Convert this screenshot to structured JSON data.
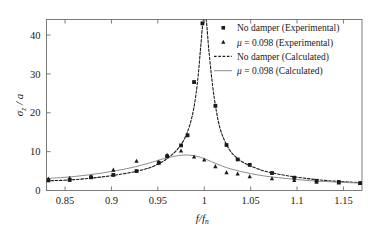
{
  "chart_data": {
    "type": "line",
    "title": "",
    "xlabel": "f/f_n",
    "ylabel": "σ_z / a",
    "xlabel_main": "f/f",
    "xlabel_subscript": "n",
    "ylabel_main": "σ",
    "ylabel_subscript": "z",
    "ylabel_tail": " / a",
    "xlim": [
      0.83,
      1.17
    ],
    "ylim": [
      0,
      44
    ],
    "xticks": [
      0.85,
      0.9,
      0.95,
      1,
      1.05,
      1.1,
      1.15
    ],
    "xtick_labels": [
      "0.85",
      "0.9",
      "0.95",
      "1",
      "1.05",
      "1.1",
      "1.15"
    ],
    "yticks": [
      0,
      10,
      20,
      30,
      40
    ],
    "ytick_labels": [
      "0",
      "10",
      "20",
      "30",
      "40"
    ],
    "grid": false,
    "legend_position": "top-right",
    "colors": {
      "no_damper": "#1a1a1a",
      "damper": "#8c8c8c",
      "axis": "#6e6e6e",
      "text": "#1a1a1a"
    },
    "series": [
      {
        "name": "No damper (Experimental)",
        "kind": "scatter",
        "marker": "square",
        "color": "#1a1a1a",
        "points": [
          [
            0.832,
            2.6
          ],
          [
            0.855,
            2.7
          ],
          [
            0.878,
            3.4
          ],
          [
            0.902,
            4.0
          ],
          [
            0.927,
            5.0
          ],
          [
            0.951,
            7.1
          ],
          [
            0.96,
            8.8
          ],
          [
            0.975,
            11.6
          ],
          [
            0.982,
            14.2
          ],
          [
            0.989,
            27.9
          ],
          [
            0.998,
            43.0
          ],
          [
            1.012,
            21.8
          ],
          [
            1.024,
            11.7
          ],
          [
            1.036,
            8.0
          ],
          [
            1.049,
            6.6
          ],
          [
            1.073,
            4.5
          ],
          [
            1.097,
            3.3
          ],
          [
            1.121,
            2.5
          ],
          [
            1.145,
            2.2
          ],
          [
            1.168,
            1.9
          ]
        ]
      },
      {
        "name": "μ = 0.098 (Experimental)",
        "kind": "scatter",
        "marker": "triangle",
        "color": "#1a1a1a",
        "points": [
          [
            0.832,
            3.0
          ],
          [
            0.855,
            3.2
          ],
          [
            0.878,
            3.6
          ],
          [
            0.902,
            5.3
          ],
          [
            0.927,
            7.6
          ],
          [
            0.951,
            7.4
          ],
          [
            0.96,
            9.1
          ],
          [
            0.975,
            10.2
          ],
          [
            0.989,
            8.7
          ],
          [
            1.0,
            7.9
          ],
          [
            1.012,
            6.2
          ],
          [
            1.024,
            4.6
          ],
          [
            1.036,
            4.3
          ],
          [
            1.049,
            3.6
          ],
          [
            1.073,
            3.1
          ],
          [
            1.097,
            2.6
          ],
          [
            1.121,
            2.2
          ],
          [
            1.145,
            2.0
          ],
          [
            1.168,
            1.9
          ]
        ]
      },
      {
        "name": "No damper (Calculated)",
        "kind": "line",
        "style": "dashed",
        "color": "#1a1a1a",
        "points": [
          [
            0.83,
            2.5
          ],
          [
            0.845,
            2.6
          ],
          [
            0.86,
            2.8
          ],
          [
            0.875,
            3.1
          ],
          [
            0.89,
            3.5
          ],
          [
            0.905,
            4.0
          ],
          [
            0.92,
            4.6
          ],
          [
            0.935,
            5.4
          ],
          [
            0.945,
            6.2
          ],
          [
            0.955,
            7.4
          ],
          [
            0.962,
            8.6
          ],
          [
            0.97,
            10.3
          ],
          [
            0.978,
            13.0
          ],
          [
            0.984,
            16.5
          ],
          [
            0.989,
            21.5
          ],
          [
            0.993,
            28.5
          ],
          [
            0.996,
            36.5
          ],
          [
            0.999,
            44.0
          ],
          [
            1.002,
            44.0
          ],
          [
            1.005,
            36.0
          ],
          [
            1.009,
            27.0
          ],
          [
            1.013,
            20.5
          ],
          [
            1.017,
            16.0
          ],
          [
            1.022,
            12.8
          ],
          [
            1.028,
            10.2
          ],
          [
            1.035,
            8.4
          ],
          [
            1.043,
            7.1
          ],
          [
            1.052,
            6.1
          ],
          [
            1.065,
            5.0
          ],
          [
            1.08,
            4.2
          ],
          [
            1.095,
            3.6
          ],
          [
            1.11,
            3.1
          ],
          [
            1.125,
            2.7
          ],
          [
            1.14,
            2.4
          ],
          [
            1.155,
            2.2
          ],
          [
            1.17,
            2.0
          ]
        ]
      },
      {
        "name": "μ = 0.098 (Calculated)",
        "kind": "line",
        "style": "solid",
        "color": "#8c8c8c",
        "points": [
          [
            0.83,
            3.1
          ],
          [
            0.845,
            3.3
          ],
          [
            0.86,
            3.6
          ],
          [
            0.875,
            4.0
          ],
          [
            0.89,
            4.5
          ],
          [
            0.905,
            5.1
          ],
          [
            0.92,
            5.8
          ],
          [
            0.932,
            6.5
          ],
          [
            0.944,
            7.3
          ],
          [
            0.952,
            7.9
          ],
          [
            0.96,
            8.4
          ],
          [
            0.968,
            8.8
          ],
          [
            0.976,
            9.1
          ],
          [
            0.984,
            9.1
          ],
          [
            0.992,
            8.8
          ],
          [
            1.0,
            8.2
          ],
          [
            1.008,
            7.4
          ],
          [
            1.016,
            6.6
          ],
          [
            1.024,
            5.9
          ],
          [
            1.034,
            5.2
          ],
          [
            1.045,
            4.6
          ],
          [
            1.058,
            4.0
          ],
          [
            1.072,
            3.5
          ],
          [
            1.088,
            3.1
          ],
          [
            1.105,
            2.7
          ],
          [
            1.122,
            2.4
          ],
          [
            1.14,
            2.2
          ],
          [
            1.158,
            2.0
          ],
          [
            1.17,
            1.9
          ]
        ]
      }
    ],
    "legend": [
      {
        "label": "No damper (Experimental)",
        "marker": "square",
        "color": "#1a1a1a",
        "italic_prefix": ""
      },
      {
        "label": " = 0.098 (Experimental)",
        "marker": "triangle",
        "color": "#1a1a1a",
        "italic_prefix": "μ"
      },
      {
        "label": "No damper (Calculated)",
        "marker": "dashed-line",
        "color": "#1a1a1a",
        "italic_prefix": ""
      },
      {
        "label": " = 0.098 (Calculated)",
        "marker": "solid-line",
        "color": "#8c8c8c",
        "italic_prefix": "μ"
      }
    ]
  }
}
